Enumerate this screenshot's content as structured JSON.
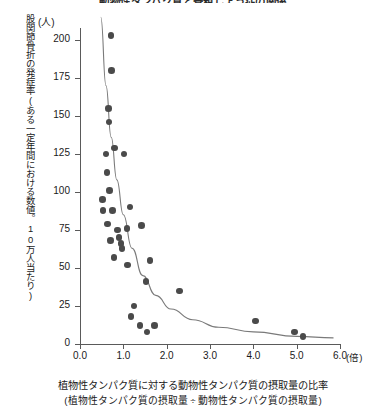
{
  "chart_data": {
    "type": "scatter",
    "title": "動物性タンパク質と骨粗しょう症の関係",
    "xlabel": "植物性タンパク質に対する動物性タンパク質の摂取量の比率",
    "xlabel_sub": "(植物性タンパク質の摂取量 ÷ 動物性タンパク質の摂取量)",
    "ylabel": "股関節骨折の発症率(ある一定年間における数値。10万人当たり)",
    "x_unit": "(倍)",
    "y_unit": "(人)",
    "xlim": [
      0.0,
      6.0
    ],
    "ylim": [
      0,
      200
    ],
    "xticks": [
      "0.0",
      "1.0",
      "2.0",
      "3.0",
      "4.0",
      "5.0",
      "6.0"
    ],
    "xtick_values": [
      0.0,
      1.0,
      2.0,
      3.0,
      4.0,
      5.0,
      6.0
    ],
    "yticks": [
      "0",
      "25",
      "50",
      "75",
      "100",
      "125",
      "150",
      "175",
      "200"
    ],
    "ytick_values": [
      0,
      25,
      50,
      75,
      100,
      125,
      150,
      175,
      200
    ],
    "grid": false,
    "legend": false,
    "marker_color": "#4a4a4a",
    "curve_color": "#7a7a7a",
    "axis_color": "#5a5a5a",
    "points": [
      {
        "x": 0.72,
        "y": 203
      },
      {
        "x": 0.73,
        "y": 180
      },
      {
        "x": 0.66,
        "y": 155
      },
      {
        "x": 0.67,
        "y": 146
      },
      {
        "x": 0.6,
        "y": 125
      },
      {
        "x": 0.62,
        "y": 113
      },
      {
        "x": 0.68,
        "y": 101
      },
      {
        "x": 0.52,
        "y": 95
      },
      {
        "x": 0.53,
        "y": 88
      },
      {
        "x": 0.75,
        "y": 88
      },
      {
        "x": 1.15,
        "y": 90
      },
      {
        "x": 0.63,
        "y": 79
      },
      {
        "x": 1.08,
        "y": 76
      },
      {
        "x": 0.8,
        "y": 129
      },
      {
        "x": 1.02,
        "y": 125
      },
      {
        "x": 0.86,
        "y": 75
      },
      {
        "x": 1.42,
        "y": 78
      },
      {
        "x": 0.7,
        "y": 68
      },
      {
        "x": 0.9,
        "y": 70
      },
      {
        "x": 0.95,
        "y": 66
      },
      {
        "x": 0.97,
        "y": 63
      },
      {
        "x": 0.78,
        "y": 57
      },
      {
        "x": 1.1,
        "y": 52
      },
      {
        "x": 1.62,
        "y": 55
      },
      {
        "x": 1.52,
        "y": 41
      },
      {
        "x": 2.3,
        "y": 35
      },
      {
        "x": 1.25,
        "y": 25
      },
      {
        "x": 1.18,
        "y": 18
      },
      {
        "x": 1.38,
        "y": 12
      },
      {
        "x": 1.55,
        "y": 8
      },
      {
        "x": 1.72,
        "y": 12
      },
      {
        "x": 4.05,
        "y": 15
      },
      {
        "x": 4.95,
        "y": 8
      },
      {
        "x": 5.15,
        "y": 5
      }
    ],
    "fit_curve": {
      "description": "decaying power/exponential trend line",
      "points": [
        {
          "x": 0.48,
          "y": 215
        },
        {
          "x": 0.6,
          "y": 170
        },
        {
          "x": 0.72,
          "y": 136
        },
        {
          "x": 0.85,
          "y": 108
        },
        {
          "x": 1.0,
          "y": 85
        },
        {
          "x": 1.2,
          "y": 63
        },
        {
          "x": 1.45,
          "y": 45
        },
        {
          "x": 1.75,
          "y": 32
        },
        {
          "x": 2.1,
          "y": 23
        },
        {
          "x": 2.6,
          "y": 16
        },
        {
          "x": 3.2,
          "y": 11
        },
        {
          "x": 4.0,
          "y": 8
        },
        {
          "x": 5.0,
          "y": 5
        },
        {
          "x": 5.85,
          "y": 4
        }
      ]
    }
  }
}
